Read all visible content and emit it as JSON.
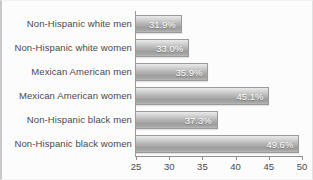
{
  "chart_data": {
    "type": "bar",
    "orientation": "horizontal",
    "title": "",
    "xlabel": "",
    "ylabel": "",
    "xlim": [
      25,
      50
    ],
    "xticks": [
      25,
      30,
      35,
      40,
      45,
      50
    ],
    "grid": false,
    "legend": false,
    "value_suffix": "%",
    "categories": [
      "Non-Hispanic white men",
      "Non-Hispanic white women",
      "Mexican American men",
      "Mexican American women",
      "Non-Hispanic black men",
      "Non-Hispanic black women"
    ],
    "values": [
      31.9,
      33.0,
      35.9,
      45.1,
      37.3,
      49.6
    ],
    "value_labels": [
      "31.9%",
      "33.0%",
      "35.9%",
      "45.1%",
      "37.3%",
      "49.6%"
    ],
    "colors": {
      "bar_top": "#e9e9e9",
      "bar_bottom": "#9e9e9e",
      "bar_border": "#9a9a9a",
      "value_text": "#ffffff",
      "axis": "#8f8f8f",
      "label_text": "#4a4a4a",
      "background": "#fcfcfc",
      "frame": "#c8c8c8"
    }
  }
}
